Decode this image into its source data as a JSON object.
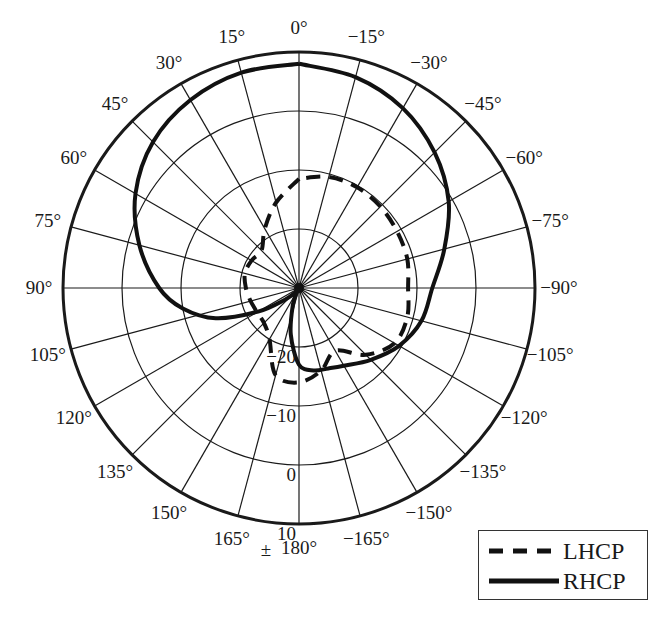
{
  "chart_data": {
    "type": "polar-line",
    "title": "",
    "angle_zero": "top",
    "angle_direction": "positive angles counter-clockwise (left), negative clockwise (right)",
    "angle_ticks": [
      0,
      15,
      30,
      45,
      60,
      75,
      90,
      105,
      120,
      135,
      150,
      165,
      180,
      -165,
      -150,
      -135,
      -120,
      -105,
      -90,
      -75,
      -60,
      -45,
      -30,
      -15
    ],
    "angle_tick_labels": [
      "0°",
      "15°",
      "30°",
      "45°",
      "60°",
      "75°",
      "90°",
      "105°",
      "120°",
      "135°",
      "150°",
      "165°",
      "180°",
      "−165°",
      "−150°",
      "−135°",
      "−120°",
      "−105°",
      "−90°",
      "−75°",
      "−60°",
      "−45°",
      "−30°",
      "−15°"
    ],
    "radial_ticks": [
      -20,
      -10,
      0,
      10
    ],
    "radial_tick_labels": [
      "−20",
      "−10",
      "0",
      "10"
    ],
    "radial_extra_label": "±",
    "rlim": [
      -30,
      10
    ],
    "radial_unit": "dB",
    "grid": true,
    "legend_position": "lower right",
    "series": [
      {
        "name": "LHCP",
        "style": "dashed",
        "angles": [
          0,
          15,
          30,
          45,
          60,
          75,
          90,
          105,
          120,
          135,
          150,
          165,
          180,
          -165,
          -150,
          -135,
          -120,
          -105,
          -90,
          -75,
          -60,
          -45,
          -30,
          -15,
          0
        ],
        "values": [
          -11.5,
          -15,
          -18.4,
          -21,
          -20.7,
          -20.5,
          -21,
          -21.5,
          -21.8,
          -21.6,
          -20,
          -14.7,
          -14,
          -15.5,
          -17.7,
          -14,
          -11.3,
          -11,
          -11.5,
          -11,
          -10.8,
          -10.5,
          -10.3,
          -10.5,
          -11.5
        ]
      },
      {
        "name": "RHCP",
        "style": "solid",
        "angles": [
          0,
          15,
          30,
          45,
          60,
          75,
          90,
          100,
          110,
          120,
          130,
          140,
          150,
          160,
          170,
          180,
          -170,
          -160,
          -150,
          -135,
          -120,
          -105,
          -90,
          -75,
          -60,
          -45,
          -30,
          -15,
          0
        ],
        "values": [
          8,
          7.8,
          6.8,
          5.0,
          2.0,
          -2.0,
          -6.3,
          -10,
          -15,
          -22,
          -27,
          -29,
          -29.5,
          -27,
          -22,
          -17,
          -15.8,
          -15.5,
          -14.8,
          -12.8,
          -10.4,
          -8.5,
          -7.4,
          -4.5,
          -0.7,
          2.5,
          5.2,
          7.0,
          8
        ]
      }
    ]
  },
  "legend": {
    "items": [
      {
        "label": "LHCP",
        "style": "dashed"
      },
      {
        "label": "RHCP",
        "style": "solid"
      }
    ]
  }
}
